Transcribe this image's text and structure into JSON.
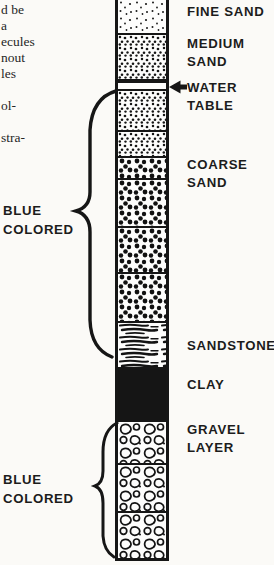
{
  "colors": {
    "ink": "#161616",
    "paper": "#fbfaf7"
  },
  "marginalia": {
    "lines": [
      "d be",
      "a",
      "ecules",
      "nout",
      "les",
      "",
      "ol-",
      "",
      "stra-"
    ]
  },
  "figure": {
    "column_layers": [
      {
        "name": "fine-sand",
        "pattern": "fine-dots",
        "height": 33,
        "divider": false
      },
      {
        "name": "medium-sand",
        "pattern": "medium-dots",
        "height": 46,
        "divider": true
      },
      {
        "name": "water-table-bar",
        "pattern": "solid-black",
        "height": 4,
        "divider": false
      },
      {
        "name": "water-table-gap",
        "pattern": "blank",
        "height": 6,
        "divider": false
      },
      {
        "name": "sand-below-water-1",
        "pattern": "medium-dots",
        "height": 41,
        "divider": true
      },
      {
        "name": "sand-below-water-2",
        "pattern": "medium-dots",
        "height": 26,
        "divider": true
      },
      {
        "name": "coarse-sand-1",
        "pattern": "coarse-dots",
        "height": 22,
        "divider": true
      },
      {
        "name": "coarse-sand-2",
        "pattern": "coarse-dots",
        "height": 48,
        "divider": true
      },
      {
        "name": "coarse-sand-3",
        "pattern": "coarse-dots",
        "height": 46,
        "divider": true
      },
      {
        "name": "coarse-sand-4",
        "pattern": "coarse-dots",
        "height": 49,
        "divider": true
      },
      {
        "name": "sandstone",
        "pattern": "sandstone-lines",
        "height": 46,
        "divider": true
      },
      {
        "name": "clay",
        "pattern": "solid-black",
        "height": 53,
        "divider": true
      },
      {
        "name": "gravel-1",
        "pattern": "gravel",
        "height": 43,
        "divider": true
      },
      {
        "name": "gravel-2",
        "pattern": "gravel",
        "height": 48,
        "divider": true
      },
      {
        "name": "gravel-3",
        "pattern": "gravel",
        "height": 47,
        "divider": true
      }
    ],
    "right_labels": [
      {
        "name": "fine-sand",
        "lines": [
          "FINE SAND"
        ],
        "top": 3
      },
      {
        "name": "medium-sand",
        "lines": [
          "MEDIUM",
          "SAND"
        ],
        "top": 35
      },
      {
        "name": "water-table",
        "lines": [
          "WATER",
          "TABLE"
        ],
        "top": 79
      },
      {
        "name": "coarse-sand",
        "lines": [
          "COARSE",
          "SAND"
        ],
        "top": 156
      },
      {
        "name": "sandstone",
        "lines": [
          "SANDSTONE"
        ],
        "top": 337
      },
      {
        "name": "clay",
        "lines": [
          "CLAY"
        ],
        "top": 376
      },
      {
        "name": "gravel-layer",
        "lines": [
          "GRAVEL",
          "LAYER"
        ],
        "top": 421
      }
    ],
    "left_labels": [
      {
        "name": "blue-colored-upper",
        "lines": [
          "BLUE",
          "COLORED"
        ],
        "top": 201
      },
      {
        "name": "blue-colored-lower",
        "lines": [
          "BLUE",
          "COLORED"
        ],
        "top": 470
      }
    ]
  }
}
